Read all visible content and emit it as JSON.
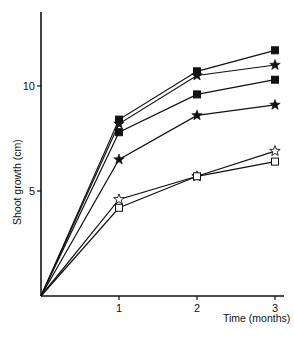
{
  "chart_data": {
    "type": "line",
    "title": "",
    "xlabel": "Time (months)",
    "ylabel": "Shoot growth  (cm)",
    "x": [
      0,
      1,
      2,
      3
    ],
    "xticks": [
      1,
      2,
      3
    ],
    "yticks": [
      5,
      10
    ],
    "xlim": [
      0,
      3.1
    ],
    "ylim": [
      0,
      14
    ],
    "grid": false,
    "legend": null,
    "series": [
      {
        "name": "filled-square-a",
        "marker": "filled-square",
        "values": [
          0,
          8.4,
          10.7,
          11.7
        ]
      },
      {
        "name": "filled-star-a",
        "marker": "filled-star",
        "values": [
          0,
          8.2,
          10.5,
          11.0
        ]
      },
      {
        "name": "filled-square-b",
        "marker": "filled-square",
        "values": [
          0,
          7.8,
          9.6,
          10.3
        ]
      },
      {
        "name": "filled-star-b",
        "marker": "filled-star",
        "values": [
          0,
          6.5,
          8.6,
          9.1
        ]
      },
      {
        "name": "open-star",
        "marker": "open-star",
        "values": [
          0,
          4.6,
          5.7,
          6.9
        ]
      },
      {
        "name": "open-square",
        "marker": "open-square",
        "values": [
          0,
          4.2,
          5.7,
          6.4
        ]
      }
    ]
  },
  "axes": {
    "x_tick_labels": [
      "1",
      "2",
      "3"
    ],
    "y_tick_labels": [
      "5",
      "10"
    ],
    "x_title": "Time (months)",
    "y_title": "Shoot growth  (cm)"
  },
  "colors": {
    "ink": "#111111",
    "background": "#ffffff"
  }
}
